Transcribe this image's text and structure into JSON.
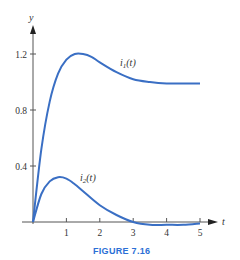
{
  "caption": "FIGURE 7.16",
  "chart_data": {
    "type": "line",
    "title": "",
    "xlabel": "t",
    "ylabel": "y",
    "xlim": [
      0,
      5.3
    ],
    "ylim": [
      0,
      1.4
    ],
    "x_ticks": [
      "1",
      "2",
      "3",
      "4",
      "5"
    ],
    "y_ticks": [
      "0.4",
      "0.8",
      "1.2"
    ],
    "grid": false,
    "legend": "inline labels",
    "series": [
      {
        "name": "i1(t)",
        "label_main": "i",
        "label_sub": "1",
        "label_tail": "(t)",
        "color": "#3a6fc4",
        "x": [
          0,
          0.25,
          0.5,
          0.75,
          1.0,
          1.25,
          1.5,
          1.75,
          2.0,
          2.5,
          3.0,
          3.5,
          4.0,
          4.5,
          5.0
        ],
        "values": [
          0,
          0.52,
          0.86,
          1.06,
          1.16,
          1.2,
          1.2,
          1.18,
          1.14,
          1.07,
          1.02,
          1.0,
          0.99,
          0.99,
          0.99
        ]
      },
      {
        "name": "i2(t)",
        "label_main": "i",
        "label_sub": "2",
        "label_tail": "(t)",
        "color": "#3a6fc4",
        "x": [
          0,
          0.25,
          0.5,
          0.75,
          1.0,
          1.25,
          1.5,
          2.0,
          2.5,
          3.0,
          3.5,
          4.0,
          4.5,
          5.0
        ],
        "values": [
          0,
          0.2,
          0.29,
          0.32,
          0.31,
          0.27,
          0.22,
          0.12,
          0.05,
          0.0,
          -0.02,
          -0.02,
          -0.02,
          -0.01
        ]
      }
    ]
  }
}
